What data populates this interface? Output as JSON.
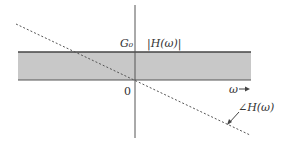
{
  "diagram": {
    "type": "frequency-response",
    "labels": {
      "gain_level": "G₀",
      "magnitude": "|H(ω)|",
      "origin": "0",
      "frequency_axis": "ω →",
      "phase": "∠H(ω)"
    },
    "colors": {
      "band_fill": "#c8c8c8",
      "band_edge": "#444444",
      "axis": "#555555",
      "phase_line": "#555555"
    }
  }
}
